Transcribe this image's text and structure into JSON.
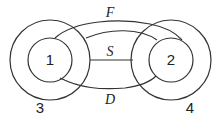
{
  "diagram": {
    "nodes": [
      {
        "id": "1",
        "label": "1",
        "type": "inner-circle",
        "parent": "3"
      },
      {
        "id": "2",
        "label": "2",
        "type": "inner-circle",
        "parent": "4"
      },
      {
        "id": "3",
        "label": "3",
        "type": "outer-circle"
      },
      {
        "id": "4",
        "label": "4",
        "type": "outer-circle"
      }
    ],
    "edges": [
      {
        "label": "F",
        "from": "1",
        "to": "2",
        "style": "curve-top"
      },
      {
        "label": "S",
        "from": "3",
        "to": "2",
        "style": "straight-arrow"
      },
      {
        "label": "D",
        "from": "1",
        "to": "2",
        "style": "curve-bottom"
      }
    ],
    "labels": {
      "inner_left": "1",
      "inner_right": "2",
      "outer_left": "3",
      "outer_right": "4",
      "edge_top": "F",
      "edge_mid": "S",
      "edge_bottom": "D"
    },
    "stroke_color": "#333333"
  }
}
